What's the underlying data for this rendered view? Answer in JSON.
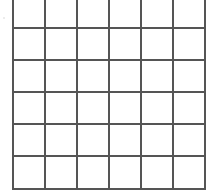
{
  "grid": {
    "columns": 6,
    "rows": 6,
    "line_color": "#555555",
    "background": "#ffffff",
    "vertical_lines_x": [
      12,
      44,
      76,
      108,
      140,
      172,
      204
    ],
    "horizontal_lines_y": [
      27,
      59,
      91,
      123,
      155,
      188
    ],
    "top": 0,
    "bottom": 190,
    "left": 12,
    "right": 206
  }
}
